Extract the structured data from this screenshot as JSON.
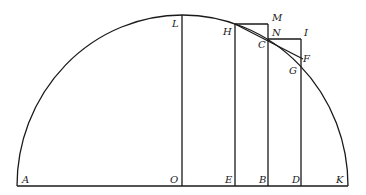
{
  "diagram": {
    "points": {
      "A": {
        "x": 17,
        "y": 186
      },
      "K": {
        "x": 348,
        "y": 186
      },
      "O": {
        "x": 182,
        "y": 186
      },
      "L": {
        "x": 182,
        "y": 15
      },
      "E": {
        "x": 235,
        "y": 186
      },
      "B": {
        "x": 268,
        "y": 186
      },
      "D": {
        "x": 301,
        "y": 186
      },
      "H": {
        "x": 235,
        "y": 24
      },
      "M": {
        "x": 268,
        "y": 24
      },
      "N": {
        "x": 268,
        "y": 34
      },
      "C": {
        "x": 268,
        "y": 39
      },
      "I": {
        "x": 301,
        "y": 39
      },
      "F": {
        "x": 301,
        "y": 57
      },
      "G": {
        "x": 301,
        "y": 64
      }
    },
    "labels": [
      {
        "id": "A",
        "text": "A",
        "x": 22,
        "y": 183
      },
      {
        "id": "O",
        "text": "O",
        "x": 170,
        "y": 183
      },
      {
        "id": "E",
        "text": "E",
        "x": 225,
        "y": 183
      },
      {
        "id": "B",
        "text": "B",
        "x": 259,
        "y": 183
      },
      {
        "id": "D",
        "text": "D",
        "x": 292,
        "y": 183
      },
      {
        "id": "K",
        "text": "K",
        "x": 336,
        "y": 183
      },
      {
        "id": "L",
        "text": "L",
        "x": 172,
        "y": 27
      },
      {
        "id": "H",
        "text": "H",
        "x": 223,
        "y": 35
      },
      {
        "id": "M",
        "text": "M",
        "x": 272,
        "y": 21
      },
      {
        "id": "N",
        "text": "N",
        "x": 272,
        "y": 36
      },
      {
        "id": "C",
        "text": "C",
        "x": 258,
        "y": 48
      },
      {
        "id": "I",
        "text": "I",
        "x": 304,
        "y": 36
      },
      {
        "id": "F",
        "text": "F",
        "x": 303,
        "y": 62
      },
      {
        "id": "G",
        "text": "G",
        "x": 289,
        "y": 74
      }
    ]
  }
}
